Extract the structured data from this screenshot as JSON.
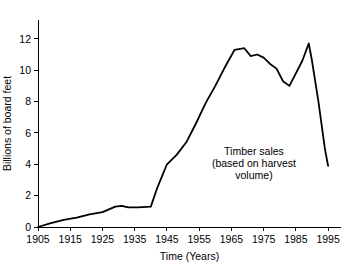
{
  "chart_data": {
    "type": "line",
    "title": "",
    "subtitle": "",
    "xlabel": "Time (Years)",
    "ylabel": "Billions of board feet",
    "xlim": [
      1905,
      1999
    ],
    "ylim": [
      0,
      13.2
    ],
    "xticks": [
      1905,
      1915,
      1925,
      1935,
      1945,
      1955,
      1965,
      1975,
      1985,
      1995
    ],
    "xtick_labels": [
      "1905",
      "1915",
      "1925",
      "1935",
      "1945",
      "1955",
      "1965",
      "1975",
      "1985",
      "1995"
    ],
    "yticks": [
      0,
      2,
      4,
      6,
      8,
      10,
      12
    ],
    "ytick_labels": [
      "0",
      "2",
      "4",
      "6",
      "8",
      "10",
      "12"
    ],
    "grid": false,
    "legend": false,
    "legend_position": "none",
    "line_color": "#000000",
    "series": [
      {
        "name": "Timber sales (based on harvest volume)",
        "x": [
          1905,
          1909,
          1913,
          1917,
          1921,
          1925,
          1929,
          1931,
          1933,
          1936,
          1940,
          1942,
          1945,
          1948,
          1951,
          1954,
          1957,
          1960,
          1963,
          1966,
          1969,
          1971,
          1973,
          1975,
          1977,
          1979,
          1981,
          1983,
          1985,
          1987,
          1989,
          1990,
          1992,
          1994,
          1995
        ],
        "values": [
          0.0,
          0.25,
          0.45,
          0.6,
          0.8,
          0.95,
          1.3,
          1.35,
          1.25,
          1.25,
          1.3,
          2.5,
          4.0,
          4.6,
          5.4,
          6.6,
          7.9,
          9.0,
          10.2,
          11.3,
          11.4,
          10.9,
          11.0,
          10.8,
          10.4,
          10.1,
          9.3,
          9.0,
          9.8,
          10.6,
          11.7,
          10.6,
          8.0,
          5.0,
          3.9
        ]
      }
    ],
    "annotations": [
      {
        "name": "timber-sales-label",
        "lines": [
          "Timber sales",
          "(based on harvest",
          "volume)"
        ],
        "x": 1972,
        "y": 4.6
      }
    ]
  }
}
